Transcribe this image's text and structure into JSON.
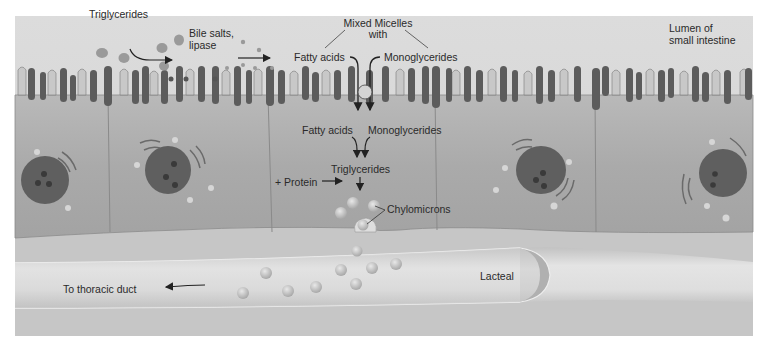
{
  "diagram": {
    "colors": {
      "background": "#ffffff",
      "lumen": "#d9d9d9",
      "cell": "#a9a9a9",
      "microvilli_dark": "#5a5a5a",
      "nucleus": "#5f5f5f",
      "lacteal": "#d4d4d4",
      "text": "#2a2a2a"
    },
    "labels": {
      "triglycerides_lumen": "Triglycerides",
      "bile_salts_line1": "Bile salts,",
      "bile_salts_line2": "lipase",
      "mixed_micelles_line1": "Mixed Micelles",
      "mixed_micelles_line2": "with",
      "fatty_acids_lumen": "Fatty acids",
      "monoglycerides_lumen": "Monoglycerides",
      "lumen_line1": "Lumen of",
      "lumen_line2": "small intestine",
      "fatty_acids_cell": "Fatty acids",
      "monoglycerides_cell": "Monoglycerides",
      "triglycerides_cell": "Triglycerides",
      "protein": "+ Protein",
      "chylomicrons": "Chylomicrons",
      "lacteal": "Lacteal",
      "thoracic_duct": "To thoracic duct"
    },
    "cells": [
      {
        "name": "epithelial-cell-1",
        "nucleus_nucleoli": 3
      },
      {
        "name": "epithelial-cell-2",
        "nucleus_nucleoli": 3
      },
      {
        "name": "epithelial-cell-3-center",
        "nucleus_nucleoli": 0
      },
      {
        "name": "epithelial-cell-4",
        "nucleus_nucleoli": 3
      },
      {
        "name": "epithelial-cell-5",
        "nucleus_nucleoli": 2
      }
    ]
  }
}
